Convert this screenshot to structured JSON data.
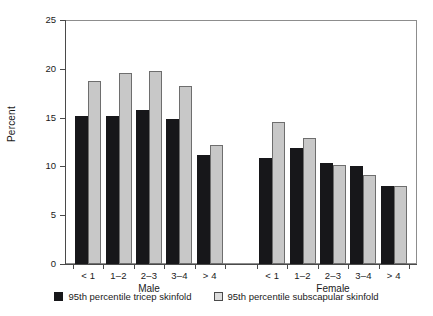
{
  "chart_data": {
    "type": "bar",
    "title": "",
    "xlabel": "",
    "ylabel": "Percent",
    "ylim": [
      0,
      25
    ],
    "yticks": [
      0,
      5,
      10,
      15,
      20,
      25
    ],
    "grid": false,
    "legend_position": "bottom",
    "groups": [
      {
        "name": "Male",
        "categories": [
          "< 1",
          "1–2",
          "2–3",
          "3–4",
          "> 4"
        ]
      },
      {
        "name": "Female",
        "categories": [
          "< 1",
          "1–2",
          "2–3",
          "3–4",
          "> 4"
        ]
      }
    ],
    "series": [
      {
        "name": "95th percentile tricep skinfold",
        "color": "#17171a",
        "values_male": [
          15.2,
          15.2,
          15.8,
          14.9,
          11.2
        ],
        "values_female": [
          10.9,
          11.9,
          10.4,
          10.0,
          8.0
        ]
      },
      {
        "name": "95th percentile subscapular skinfold",
        "color": "#c8c8c8",
        "values_male": [
          18.8,
          19.6,
          19.8,
          18.2,
          12.2
        ],
        "values_female": [
          14.5,
          12.9,
          10.1,
          9.1,
          8.0
        ]
      }
    ],
    "legend": [
      {
        "label": "95th percentile tricep skinfold",
        "swatch": "dark"
      },
      {
        "label": "95th percentile subscapular skinfold",
        "swatch": "light"
      }
    ]
  }
}
